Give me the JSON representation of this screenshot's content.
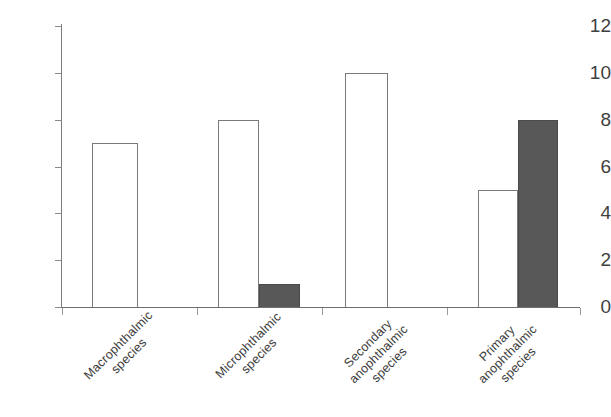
{
  "chart_data": {
    "type": "bar",
    "title": "",
    "subtitle": "",
    "xlabel": "",
    "ylabel": "",
    "ylim": [
      0,
      12
    ],
    "ytick_step": 2,
    "yticks": [
      0,
      2,
      4,
      6,
      8,
      10,
      12
    ],
    "ytick_labels": [
      "0",
      "2",
      "4",
      "6",
      "8",
      "10",
      "12"
    ],
    "grid": false,
    "legend": null,
    "legend_position": "none",
    "categories": [
      "Macrophthalmic\nspecies",
      "Microphthalmic\nspecies",
      "Secondary\nanophthalmic\nspecies",
      "Primary\nanophthalmic\nspecies"
    ],
    "series": [
      {
        "name": "open",
        "style": "white-outline",
        "values": [
          7,
          8,
          10,
          5
        ]
      },
      {
        "name": "filled",
        "style": "dark-gray-fill",
        "values": [
          0,
          1,
          0,
          8
        ]
      }
    ],
    "bars": [
      {
        "category": "Macrophthalmic species",
        "series": "open",
        "value": 7,
        "x": 92,
        "width": 46,
        "fill": "#ffffff"
      },
      {
        "category": "Microphthalmic species",
        "series": "open",
        "value": 8,
        "x": 218,
        "width": 41,
        "fill": "#ffffff"
      },
      {
        "category": "Microphthalmic species",
        "series": "filled",
        "value": 1,
        "x": 259,
        "width": 41,
        "fill": "#585858"
      },
      {
        "category": "Secondary anophthalmic species",
        "series": "open",
        "value": 10,
        "x": 345,
        "width": 43,
        "fill": "#ffffff"
      },
      {
        "category": "Primary anophthalmic species",
        "series": "open",
        "value": 5,
        "x": 478,
        "width": 40,
        "fill": "#ffffff"
      },
      {
        "category": "Primary anophthalmic species",
        "series": "filled",
        "value": 8,
        "x": 518,
        "width": 40,
        "fill": "#585858"
      }
    ],
    "group_separator_ticks": [
      62,
      197,
      322,
      447,
      580
    ]
  },
  "colors": {
    "axis": "#6e6e6e",
    "bar_outline": "#7a7a7a",
    "bar_fill_dark": "#585858",
    "bar_fill_light": "#ffffff",
    "text": "#3c3c3c",
    "background": "#ffffff"
  }
}
